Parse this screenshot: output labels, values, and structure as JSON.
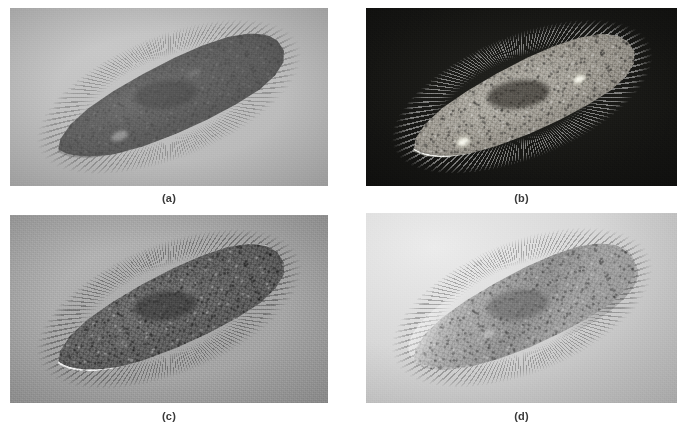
{
  "figure": {
    "layout": "2x2 panel plate",
    "page_background": "#ffffff",
    "caption_color": "#3a3a3a"
  },
  "panels": [
    {
      "id": "a",
      "caption": "(a)",
      "technique": "Brightfield microscopy",
      "subject": "Paramecium",
      "background_color": "#bcbcbc",
      "cell_color": "#5e5e5e",
      "description": "Dark elongated slipper-shaped cell on a light gray field with a faint ciliary fringe"
    },
    {
      "id": "b",
      "caption": "(b)",
      "technique": "Darkfield microscopy",
      "subject": "Paramecium",
      "background_color": "#141412",
      "cell_color": "#9a968d",
      "description": "Brightly outlined luminous cell on a near-black field with a dark macronucleus"
    },
    {
      "id": "c",
      "caption": "(c)",
      "technique": "Phase contrast microscopy",
      "subject": "Paramecium",
      "background_color": "#a6a6a6",
      "cell_color": "#585858",
      "description": "Dark granular cytoplasm ringed by a bright white halo with radiating cilia"
    },
    {
      "id": "d",
      "caption": "(d)",
      "technique": "Differential interference contrast microscopy",
      "subject": "Paramecium",
      "background_color": "#d8d8d8",
      "cell_color": "#a2a2a2",
      "description": "Shaded three-dimensional relief of the cell on a pale gradient field"
    }
  ]
}
